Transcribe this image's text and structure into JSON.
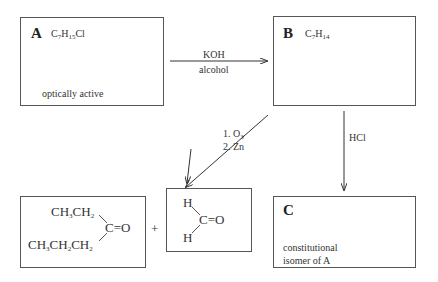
{
  "compounds": {
    "A": {
      "label": "A",
      "formula": {
        "c": "C",
        "c_n": "7",
        "h": "H",
        "h_n": "15",
        "rest": "Cl"
      },
      "note": "optically active"
    },
    "B": {
      "label": "B",
      "formula": {
        "c": "C",
        "c_n": "7",
        "h": "H",
        "h_n": "14"
      }
    },
    "C": {
      "label": "C",
      "note_line1": "constitutional",
      "note_line2": "isomer of A"
    }
  },
  "reactions": {
    "a_to_b": {
      "above": "KOH",
      "below": "alcohol"
    },
    "b_to_c": {
      "reagent": "HCl"
    },
    "ozonolysis": {
      "step1_num": "1.",
      "step1_reagent": "O",
      "step1_sub": "3",
      "step2_num": "2.",
      "step2_reagent": "Zn"
    }
  },
  "products": {
    "ketone": {
      "top_group": {
        "a": "CH",
        "a_sub": "3",
        "b": "CH",
        "b_sub": "2"
      },
      "bottom_group": {
        "a": "CH",
        "a_sub": "3",
        "b": "CH",
        "b_sub": "2",
        "c": "CH",
        "c_sub": "2"
      },
      "carbonyl": "C=O"
    },
    "plus": "+",
    "formaldehyde": {
      "h_top": "H",
      "h_bottom": "H",
      "carbonyl": "C=O"
    }
  }
}
